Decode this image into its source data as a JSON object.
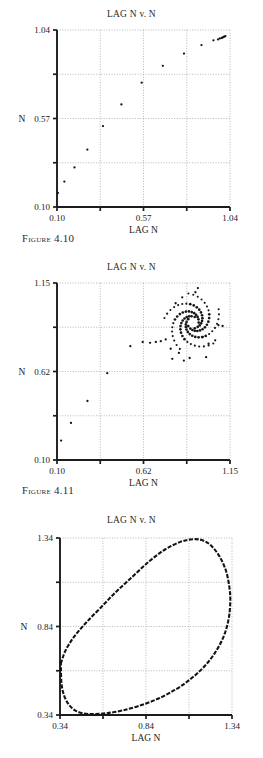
{
  "document": {
    "type": "book-page-figures",
    "background_color": "#ffffff",
    "text_color": "#1a1a1a"
  },
  "figures": [
    {
      "id": "figure-4-10",
      "caption_label": "Figure",
      "caption_number": "4.10",
      "caption_full": "FIGURE 4.10"
    },
    {
      "id": "figure-4-11",
      "caption_label": "Figure",
      "caption_number": "4.11",
      "caption_full": "FIGURE 4.11"
    }
  ],
  "chart_data": [
    {
      "id": "chart-1",
      "figure": "4.10",
      "type": "scatter",
      "title": "LAG N v. N",
      "xlabel": "LAG N",
      "ylabel": "N",
      "xlim": [
        0.1,
        1.04
      ],
      "ylim": [
        0.1,
        1.04
      ],
      "xticks": [
        0.1,
        0.57,
        1.04
      ],
      "xticklabels": [
        "0.10",
        "0.57",
        "1.04"
      ],
      "yticks": [
        0.1,
        0.57,
        1.04
      ],
      "yticklabels": [
        "0.10",
        "0.57",
        "1.04"
      ],
      "minor_ticks": true,
      "grid": "dotted",
      "marker": "dot",
      "description": "Monotonic rising sequence converging to fixed point near (1.0, 1.0)",
      "points": [
        [
          0.105,
          0.175
        ],
        [
          0.14,
          0.235
        ],
        [
          0.195,
          0.31
        ],
        [
          0.265,
          0.405
        ],
        [
          0.35,
          0.53
        ],
        [
          0.45,
          0.645
        ],
        [
          0.56,
          0.76
        ],
        [
          0.675,
          0.85
        ],
        [
          0.79,
          0.915
        ],
        [
          0.885,
          0.96
        ],
        [
          0.95,
          0.985
        ],
        [
          0.985,
          0.995
        ],
        [
          1.0,
          1.0
        ],
        [
          1.005,
          1.003
        ],
        [
          0.995,
          0.998
        ],
        [
          1.01,
          1.005
        ],
        [
          0.975,
          0.99
        ],
        [
          1.015,
          1.008
        ]
      ]
    },
    {
      "id": "chart-2",
      "figure": "4.11",
      "type": "scatter",
      "title": "LAG N v. N",
      "xlabel": "LAG N",
      "ylabel": "N",
      "xlim": [
        0.1,
        1.15
      ],
      "ylim": [
        0.1,
        1.15
      ],
      "xticks": [
        0.1,
        0.62,
        1.15
      ],
      "xticklabels": [
        "0.10",
        "0.62",
        "1.15"
      ],
      "yticks": [
        0.1,
        0.62,
        1.15
      ],
      "yticklabels": [
        "0.10",
        "0.62",
        "1.15"
      ],
      "minor_ticks": true,
      "grid": "dotted",
      "marker": "dot",
      "description": "Transient rising sequence then a multi-armed spiral (pinwheel) attractor centred near (0.93, 0.93)",
      "transient_points": [
        [
          0.125,
          0.215
        ],
        [
          0.185,
          0.32
        ],
        [
          0.285,
          0.45
        ],
        [
          0.405,
          0.615
        ],
        [
          0.545,
          0.775
        ],
        [
          0.62,
          0.8
        ],
        [
          0.665,
          0.795
        ],
        [
          0.7,
          0.8
        ],
        [
          0.73,
          0.805
        ],
        [
          0.76,
          0.815
        ],
        [
          0.79,
          0.76
        ],
        [
          0.8,
          0.7
        ],
        [
          0.84,
          0.735
        ],
        [
          0.87,
          0.69
        ],
        [
          0.905,
          0.705
        ],
        [
          1.005,
          0.71
        ],
        [
          1.02,
          0.79
        ],
        [
          0.985,
          0.83
        ],
        [
          1.06,
          0.81
        ],
        [
          0.82,
          1.03
        ],
        [
          0.86,
          1.065
        ],
        [
          0.94,
          1.095
        ],
        [
          0.955,
          1.12
        ],
        [
          1.08,
          0.9
        ],
        [
          1.105,
          0.895
        ]
      ],
      "spiral": {
        "center": [
          0.925,
          0.915
        ],
        "arms": 5,
        "turn": 1.35,
        "r_min": 0.035,
        "r_max": 0.175,
        "points_per_arm": 19
      }
    },
    {
      "id": "chart-3",
      "type": "line",
      "title": "LAG N v. N",
      "xlabel": "LAG N",
      "ylabel": "N",
      "xlim": [
        0.34,
        1.34
      ],
      "ylim": [
        0.34,
        1.34
      ],
      "xticks": [
        0.34,
        0.84,
        1.34
      ],
      "xticklabels": [
        "0.34",
        "0.84",
        "1.34"
      ],
      "yticks": [
        0.34,
        0.84,
        1.34
      ],
      "yticklabels": [
        "0.34",
        "0.84",
        "1.34"
      ],
      "minor_ticks": true,
      "grid": "dotted",
      "description": "Closed invariant loop (limit cycle) filling most of the plot area",
      "loop": [
        [
          0.345,
          0.63
        ],
        [
          0.37,
          0.7
        ],
        [
          0.42,
          0.78
        ],
        [
          0.49,
          0.86
        ],
        [
          0.575,
          0.945
        ],
        [
          0.665,
          1.035
        ],
        [
          0.76,
          1.12
        ],
        [
          0.855,
          1.205
        ],
        [
          0.95,
          1.275
        ],
        [
          1.04,
          1.318
        ],
        [
          1.11,
          1.333
        ],
        [
          1.165,
          1.328
        ],
        [
          1.215,
          1.3
        ],
        [
          1.265,
          1.24
        ],
        [
          1.305,
          1.155
        ],
        [
          1.325,
          1.06
        ],
        [
          1.33,
          0.98
        ],
        [
          1.32,
          0.88
        ],
        [
          1.29,
          0.78
        ],
        [
          1.24,
          0.69
        ],
        [
          1.175,
          0.61
        ],
        [
          1.095,
          0.54
        ],
        [
          1.005,
          0.48
        ],
        [
          0.905,
          0.43
        ],
        [
          0.8,
          0.392
        ],
        [
          0.7,
          0.365
        ],
        [
          0.61,
          0.35
        ],
        [
          0.53,
          0.345
        ],
        [
          0.47,
          0.35
        ],
        [
          0.425,
          0.368
        ],
        [
          0.39,
          0.4
        ],
        [
          0.362,
          0.455
        ],
        [
          0.348,
          0.525
        ],
        [
          0.345,
          0.63
        ]
      ]
    }
  ]
}
